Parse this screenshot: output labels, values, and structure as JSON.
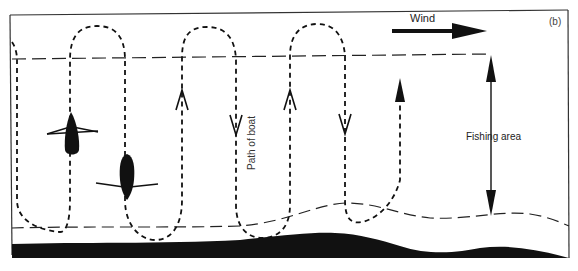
{
  "figure": {
    "panel_label": "(b)",
    "wind": {
      "label": "Wind",
      "direction": "right"
    },
    "fishing_area": {
      "label": "Fishing area"
    },
    "path": {
      "label": "Path of boat"
    },
    "boats": [
      {
        "name": "boat-1",
        "heading": "up"
      },
      {
        "name": "boat-2",
        "heading": "down"
      }
    ],
    "colors": {
      "ink": "#111111",
      "background": "#ffffff"
    }
  }
}
